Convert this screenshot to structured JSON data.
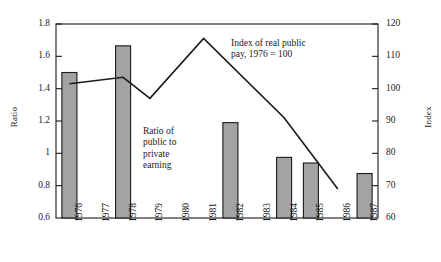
{
  "chart_data": {
    "type": "bar",
    "title": "",
    "subtitle": "",
    "xlabel": "",
    "ylabel": "Ratio",
    "y2label": "Index",
    "categories": [
      "1976",
      "1977",
      "1978",
      "1979",
      "1980",
      "1981",
      "1982",
      "1983",
      "1984",
      "1985",
      "1986",
      "1987"
    ],
    "ylim": [
      0.6,
      1.8
    ],
    "y2lim": [
      60,
      120
    ],
    "yticks": [
      "1.8",
      "1.6",
      "1.4",
      "1.2",
      "1",
      "0.8",
      "0.6"
    ],
    "ytick_values": [
      1.8,
      1.6,
      1.4,
      1.2,
      1.0,
      0.8,
      0.6
    ],
    "y2ticks": [
      "120",
      "110",
      "100",
      "90",
      "80",
      "70",
      "60"
    ],
    "y2tick_values": [
      120,
      110,
      100,
      90,
      80,
      70,
      60
    ],
    "grid": false,
    "legend": "none",
    "series": [
      {
        "name": "Ratio of public to private earning",
        "type": "bar",
        "axis": "left",
        "color": "#a3a3a3",
        "edge_color": "#1a1a1a",
        "values": [
          1.5,
          null,
          1.665,
          null,
          null,
          null,
          1.19,
          null,
          0.975,
          0.94,
          null,
          0.875
        ]
      },
      {
        "name": "Index of real public pay, 1976 = 100",
        "type": "line",
        "axis": "right",
        "color": "#1a1a1a",
        "values": [
          101.5,
          null,
          103.5,
          97.0,
          null,
          115.5,
          null,
          null,
          91.0,
          80.0,
          69.0,
          null
        ],
        "x_points": [
          "1976",
          "1978",
          "1979",
          "1981",
          "1984",
          "1985",
          "1986"
        ],
        "y_points": [
          101.5,
          103.5,
          97.0,
          115.5,
          91.0,
          80.0,
          69.0
        ]
      }
    ],
    "annotations": [
      {
        "name": "index-annotation",
        "text": "Index of real public\npay, 1976 = 100"
      },
      {
        "name": "ratio-annotation",
        "text": "Ratio of\npublic to\nprivate\nearning"
      }
    ]
  },
  "axes": {
    "left_title": "Ratio",
    "right_title": "Index"
  }
}
